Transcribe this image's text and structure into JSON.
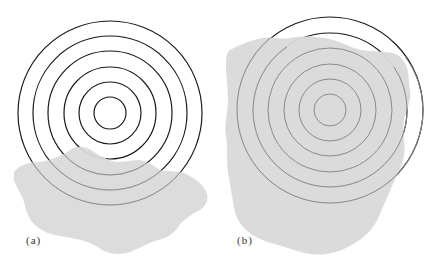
{
  "panels": [
    {
      "label": "(a)",
      "center": [
        110,
        113
      ],
      "radii": [
        16,
        31,
        46,
        62,
        77,
        92
      ],
      "description": "Concentric circles with a gray blob overlapping the lower portion"
    },
    {
      "label": "(b)",
      "center": [
        330,
        110
      ],
      "radii": [
        16,
        31,
        46,
        62,
        77,
        93
      ],
      "description": "Concentric circles mostly covered by a large gray blob; only the top arcs of the outer two rings are outside"
    }
  ],
  "colors": {
    "ring": "#1a1a1a",
    "ring_covered": "#7a7a7a",
    "blob": "#d9d9d9",
    "background": "#ffffff"
  }
}
